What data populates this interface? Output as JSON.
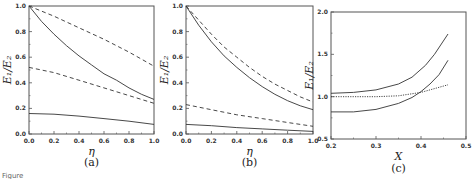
{
  "chart_data": [
    {
      "type": "line",
      "panel_label": "(a)",
      "xlabel": "η",
      "ylabel": "E₁/E₂",
      "xlim": [
        0.0,
        1.0
      ],
      "ylim": [
        0.0,
        1.0
      ],
      "xticks": [
        "0.0",
        "0.2",
        "0.4",
        "0.6",
        "0.8",
        "1.0"
      ],
      "yticks": [
        "0.0",
        "0.2",
        "0.4",
        "0.6",
        "0.8",
        "1.0"
      ],
      "grid": false,
      "series": [
        {
          "name": "solid-upper",
          "style": "solid",
          "x": [
            0,
            0.1,
            0.2,
            0.3,
            0.4,
            0.5,
            0.6,
            0.7,
            0.8,
            0.9,
            1.0
          ],
          "y": [
            1.0,
            0.88,
            0.78,
            0.69,
            0.61,
            0.54,
            0.47,
            0.42,
            0.36,
            0.31,
            0.27
          ]
        },
        {
          "name": "dashed-upper",
          "style": "dashed",
          "x": [
            0,
            0.2,
            0.4,
            0.6,
            0.8,
            1.0
          ],
          "y": [
            1.0,
            0.92,
            0.83,
            0.74,
            0.64,
            0.53
          ]
        },
        {
          "name": "dashed-lower",
          "style": "dashed",
          "x": [
            0,
            0.2,
            0.4,
            0.6,
            0.8,
            1.0
          ],
          "y": [
            0.52,
            0.48,
            0.42,
            0.36,
            0.3,
            0.24
          ]
        },
        {
          "name": "solid-lower",
          "style": "solid",
          "x": [
            0,
            0.2,
            0.4,
            0.6,
            0.8,
            1.0
          ],
          "y": [
            0.16,
            0.155,
            0.14,
            0.12,
            0.1,
            0.075
          ]
        }
      ]
    },
    {
      "type": "line",
      "panel_label": "(b)",
      "xlabel": "η",
      "ylabel": "E₁/E₂",
      "xlim": [
        0.0,
        1.0
      ],
      "ylim": [
        0.0,
        1.0
      ],
      "xticks": [
        "0.0",
        "0.2",
        "0.4",
        "0.6",
        "0.8",
        "1.0"
      ],
      "yticks": [
        "0.0",
        "0.2",
        "0.4",
        "0.6",
        "0.8",
        "1.0"
      ],
      "grid": false,
      "series": [
        {
          "name": "solid-upper",
          "style": "solid",
          "x": [
            0,
            0.1,
            0.2,
            0.3,
            0.4,
            0.5,
            0.6,
            0.7,
            0.8,
            0.9,
            1.0
          ],
          "y": [
            1.0,
            0.85,
            0.72,
            0.61,
            0.52,
            0.44,
            0.37,
            0.31,
            0.26,
            0.22,
            0.19
          ]
        },
        {
          "name": "dashed-upper",
          "style": "dashed",
          "x": [
            0,
            0.1,
            0.2,
            0.3,
            0.4,
            0.5,
            0.6,
            0.7,
            0.8,
            0.9,
            1.0
          ],
          "y": [
            1.0,
            0.89,
            0.78,
            0.68,
            0.6,
            0.52,
            0.45,
            0.39,
            0.34,
            0.29,
            0.25
          ]
        },
        {
          "name": "dashed-lower",
          "style": "dashed",
          "x": [
            0,
            0.2,
            0.4,
            0.6,
            0.8,
            1.0
          ],
          "y": [
            0.23,
            0.19,
            0.15,
            0.12,
            0.09,
            0.06
          ]
        },
        {
          "name": "solid-lower",
          "style": "solid",
          "x": [
            0,
            0.2,
            0.4,
            0.6,
            0.8,
            1.0
          ],
          "y": [
            0.075,
            0.065,
            0.05,
            0.04,
            0.03,
            0.02
          ]
        }
      ]
    },
    {
      "type": "line",
      "panel_label": "(c)",
      "xlabel": "X",
      "ylabel": "E₁/E₂",
      "xlim": [
        0.2,
        0.5
      ],
      "ylim": [
        0.5,
        2.0
      ],
      "xticks": [
        "0.2",
        "0.3",
        "0.4",
        "0.5"
      ],
      "yticks": [
        "0.5",
        "1.0",
        "1.5",
        "2.0"
      ],
      "grid": false,
      "series": [
        {
          "name": "solid-upper",
          "style": "solid",
          "x": [
            0.2,
            0.25,
            0.3,
            0.35,
            0.38,
            0.41,
            0.43,
            0.46
          ],
          "y": [
            1.04,
            1.05,
            1.08,
            1.15,
            1.23,
            1.37,
            1.5,
            1.74
          ]
        },
        {
          "name": "solid-lower",
          "style": "solid",
          "x": [
            0.2,
            0.25,
            0.3,
            0.35,
            0.38,
            0.4,
            0.42,
            0.44,
            0.46
          ],
          "y": [
            0.82,
            0.82,
            0.85,
            0.92,
            0.99,
            1.06,
            1.15,
            1.26,
            1.43
          ]
        },
        {
          "name": "dotted",
          "style": "dotted",
          "x": [
            0.2,
            0.3,
            0.35,
            0.4,
            0.46
          ],
          "y": [
            1.0,
            1.0,
            1.01,
            1.05,
            1.14
          ]
        }
      ]
    }
  ],
  "caption": {
    "fragment": "Figure"
  }
}
